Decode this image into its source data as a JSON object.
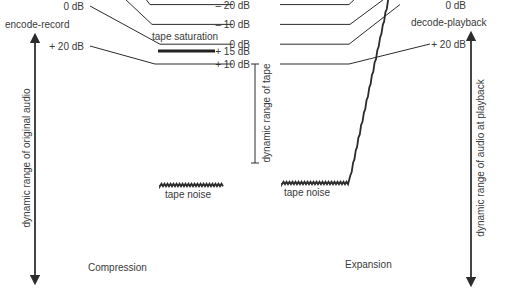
{
  "diagram": {
    "left": {
      "title": "encode-record",
      "axis_label": "dynamic range of original audio",
      "caption": "Compression",
      "levels": [
        "+ 20 dB",
        "0 dB",
        "– 20 dB",
        "– 40 dB",
        "– 60 dB",
        "– 80 dB"
      ],
      "level_values_db": [
        20,
        0,
        -20,
        -40,
        -60,
        -80
      ]
    },
    "tape": {
      "saturation_label": "tape saturation",
      "saturation_level": "+ 15 dB",
      "axis_label": "dynamic range of tape",
      "levels": [
        "+ 10 dB",
        "0 dB",
        "– 10 dB",
        "– 20 dB",
        "– 30 dB",
        "– 40 dB"
      ],
      "level_values_db": [
        10,
        0,
        -10,
        -20,
        -30,
        -40
      ],
      "noise_label_left": "tape noise",
      "noise_label_right": "tape noise"
    },
    "right": {
      "title": "decode-playback",
      "axis_label": "dynamic range of audio at playback",
      "caption": "Expansion",
      "levels": [
        "+ 20 dB",
        "0 dB",
        "– 20 dB",
        "– 40 dB",
        "– 60 dB",
        "– 80 dB",
        "– 100 dB"
      ],
      "level_values_db": [
        20,
        0,
        -20,
        -40,
        -60,
        -80,
        -100
      ]
    },
    "mapping_db": [
      {
        "original": 20,
        "tape": 10,
        "playback": 20
      },
      {
        "original": 0,
        "tape": 0,
        "playback": 0
      },
      {
        "original": -20,
        "tape": -10,
        "playback": -20
      },
      {
        "original": -40,
        "tape": -20,
        "playback": -40
      },
      {
        "original": -60,
        "tape": -30,
        "playback": -60
      },
      {
        "original": -80,
        "tape": -40,
        "playback": -80
      }
    ],
    "noise_playback_db": -100
  }
}
